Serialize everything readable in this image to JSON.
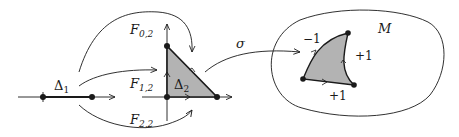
{
  "diagram": {
    "labels": {
      "delta1": {
        "main": "Δ",
        "sub": "1"
      },
      "delta2": {
        "main": "Δ",
        "sub": "2"
      },
      "f02": {
        "main": "F",
        "sub": "0,2"
      },
      "f12": {
        "main": "F",
        "sub": "1,2"
      },
      "f22": {
        "main": "F",
        "sub": "2,2"
      },
      "sigma": "σ",
      "manifold": "M",
      "edge_top": "−1",
      "edge_right": "+1",
      "edge_bottom": "+1"
    },
    "colors": {
      "stroke": "#1a1a1a",
      "fill": "#b3b3b3",
      "background": "#ffffff"
    }
  }
}
